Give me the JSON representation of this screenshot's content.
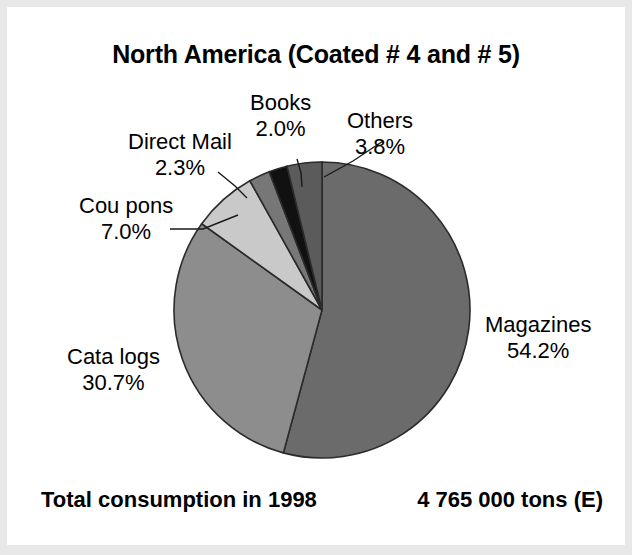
{
  "title": "North America (Coated # 4 and # 5)",
  "footer": {
    "left_label": "Total consumption in 1998",
    "right_value": "4 765 000 tons (E)"
  },
  "chart_data": {
    "type": "pie",
    "title": "North America (Coated # 4 and # 5)",
    "xlabel": "",
    "ylabel": "",
    "units": "percent of total consumption",
    "total_label": "Total consumption in 1998",
    "total_value": "4 765 000 tons (E)",
    "start_angle_deg": 0,
    "direction": "clockwise",
    "legend": "none (direct slice labels with leader lines)",
    "categories": [
      "Magazines",
      "Catalogs",
      "Coupons",
      "Direct Mail",
      "Books",
      "Others"
    ],
    "values": [
      54.2,
      30.7,
      7.0,
      2.3,
      2.0,
      3.8
    ],
    "slices": [
      {
        "name": "Magazines",
        "label": "Magazines",
        "pct_text": "54.2%",
        "value": 54.2,
        "color": "#6b6b6b",
        "label_x": 478,
        "label_y": 305,
        "label_align": "left",
        "leader": false
      },
      {
        "name": "Catalogs",
        "label": "Cata logs",
        "pct_text": "30.7%",
        "value": 30.7,
        "color": "#8d8d8d",
        "label_x": 60,
        "label_y": 337,
        "label_align": "left",
        "leader": false
      },
      {
        "name": "Coupons",
        "label": "Cou pons",
        "pct_text": "7.0%",
        "value": 7.0,
        "color": "#c9c9c9",
        "label_x": 72,
        "label_y": 186,
        "label_align": "left",
        "leader": true,
        "leader_points": "163,222 196,222 231,208"
      },
      {
        "name": "Direct Mail",
        "label": "Direct Mail",
        "pct_text": "2.3%",
        "value": 2.3,
        "color": "#777777",
        "label_x": 121,
        "label_y": 122,
        "label_align": "left",
        "leader": true,
        "leader_points": "211,165 228,179 240,191"
      },
      {
        "name": "Books",
        "label": "Books",
        "pct_text": "2.0%",
        "value": 2.0,
        "color": "#111111",
        "label_x": 243,
        "label_y": 83,
        "label_align": "left",
        "leader": true,
        "leader_points": "290,152 294,166 295,180"
      },
      {
        "name": "Others",
        "label": "Others",
        "pct_text": "3.8%",
        "value": 3.8,
        "color": "#5b5b5b",
        "label_x": 340,
        "label_y": 101,
        "label_align": "left",
        "leader": true,
        "leader_points": "376,134 346,154 317,170"
      }
    ],
    "geometry": {
      "cx": 315,
      "cy": 303,
      "r": 148
    },
    "colors": {
      "outline": "#2b2b2b",
      "background": "#ffffff",
      "text": "#000000"
    }
  }
}
